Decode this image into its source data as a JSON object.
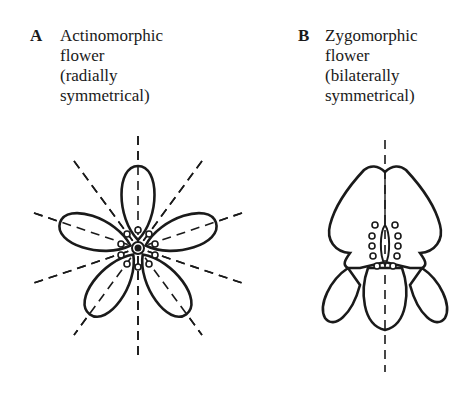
{
  "figure": {
    "panel_a": {
      "letter": "A",
      "title_lines": [
        "Actinomorphic",
        "flower",
        "(radially",
        "symmetrical)"
      ],
      "symmetry_axes": 5,
      "petals": 5
    },
    "panel_b": {
      "letter": "B",
      "title_lines": [
        "Zygomorphic",
        "flower",
        "(bilaterally",
        "symmetrical)"
      ],
      "symmetry_axes": 1,
      "petals": 5
    }
  }
}
